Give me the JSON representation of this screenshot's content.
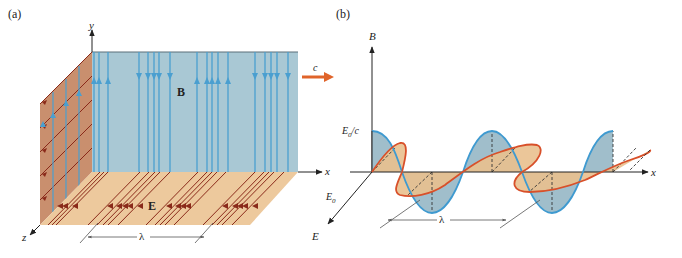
{
  "figure": {
    "panel_a": {
      "label": "(a)",
      "axis_y": "y",
      "axis_x": "x",
      "axis_z": "z",
      "field_B_label": "B",
      "field_E_label": "E",
      "velocity_label": "c",
      "wavelength_label": "λ"
    },
    "panel_b": {
      "label": "(b)",
      "axis_B": "B",
      "axis_x": "x",
      "axis_E": "E",
      "amp_B_label_main": "E",
      "amp_B_label_sub": "0",
      "amp_B_label_tail": "/c",
      "amp_E_label_main": "E",
      "amp_E_label_sub": "0",
      "wavelength_label": "λ"
    },
    "colors": {
      "b_plane": "#a9c8d4",
      "b_line": "#4a9fd0",
      "e_plane_side": "#c98f6e",
      "e_plane_floor": "#edc99d",
      "e_line": "#8a2a1a",
      "wave_blue_fill": "#8fb3c2",
      "wave_blue_stroke": "#3f9ad0",
      "wave_orange_fill": "#e9c08e",
      "wave_orange_stroke": "#d8502a",
      "arrow_c": "#e0642a",
      "axis": "#222222"
    }
  }
}
